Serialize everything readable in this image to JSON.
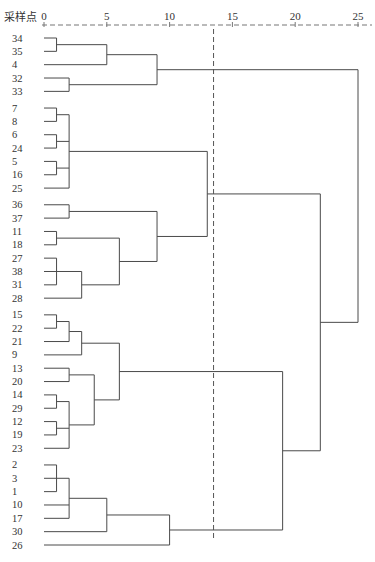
{
  "chart_data": {
    "type": "dendrogram",
    "title": "",
    "axis_title": "采样点",
    "xlabel": "Rescaled distance cluster combine",
    "x_ticks": [
      0,
      5,
      10,
      15,
      20,
      25
    ],
    "xlim": [
      0,
      25
    ],
    "cut_line": {
      "value": 13.5,
      "style": "dashed"
    },
    "leaves": [
      "34",
      "35",
      "4",
      "32",
      "33",
      "7",
      "8",
      "6",
      "24",
      "5",
      "16",
      "25",
      "36",
      "37",
      "11",
      "18",
      "27",
      "38",
      "31",
      "28",
      "15",
      "22",
      "21",
      "9",
      "13",
      "20",
      "14",
      "29",
      "12",
      "19",
      "23",
      "2",
      "3",
      "1",
      "10",
      "17",
      "30",
      "26"
    ],
    "merges": [
      {
        "id": "A",
        "children": [
          "34",
          "35"
        ],
        "height": 1
      },
      {
        "id": "B",
        "children": [
          "A",
          "4"
        ],
        "height": 5
      },
      {
        "id": "C",
        "children": [
          "32",
          "33"
        ],
        "height": 2
      },
      {
        "id": "D",
        "children": [
          "B",
          "C"
        ],
        "height": 9
      },
      {
        "id": "E1",
        "children": [
          "7",
          "8"
        ],
        "height": 1
      },
      {
        "id": "E2",
        "children": [
          "6",
          "24"
        ],
        "height": 1
      },
      {
        "id": "E3",
        "children": [
          "5",
          "16"
        ],
        "height": 1
      },
      {
        "id": "E",
        "children": [
          "E1",
          "E2",
          "E3",
          "25"
        ],
        "height": 2
      },
      {
        "id": "F",
        "children": [
          "36",
          "37"
        ],
        "height": 2
      },
      {
        "id": "G",
        "children": [
          "11",
          "18"
        ],
        "height": 1
      },
      {
        "id": "H",
        "children": [
          "27",
          "38",
          "31"
        ],
        "height": 1
      },
      {
        "id": "I",
        "children": [
          "H",
          "28"
        ],
        "height": 3
      },
      {
        "id": "J",
        "children": [
          "G",
          "I"
        ],
        "height": 6
      },
      {
        "id": "K",
        "children": [
          "F",
          "J"
        ],
        "height": 9
      },
      {
        "id": "L",
        "children": [
          "E",
          "K"
        ],
        "height": 13
      },
      {
        "id": "M1",
        "children": [
          "15",
          "22"
        ],
        "height": 1
      },
      {
        "id": "M2",
        "children": [
          "M1",
          "21"
        ],
        "height": 2
      },
      {
        "id": "M",
        "children": [
          "M2",
          "9"
        ],
        "height": 3
      },
      {
        "id": "N",
        "children": [
          "13",
          "20"
        ],
        "height": 2
      },
      {
        "id": "O1",
        "children": [
          "14",
          "29"
        ],
        "height": 1
      },
      {
        "id": "O2",
        "children": [
          "12",
          "19"
        ],
        "height": 1
      },
      {
        "id": "O",
        "children": [
          "O1",
          "O2",
          "23"
        ],
        "height": 2
      },
      {
        "id": "P",
        "children": [
          "N",
          "O"
        ],
        "height": 4
      },
      {
        "id": "Q",
        "children": [
          "M",
          "P"
        ],
        "height": 6
      },
      {
        "id": "R1",
        "children": [
          "2",
          "3",
          "1"
        ],
        "height": 1
      },
      {
        "id": "R",
        "children": [
          "R1",
          "10",
          "17"
        ],
        "height": 2
      },
      {
        "id": "S",
        "children": [
          "R",
          "30"
        ],
        "height": 5
      },
      {
        "id": "T",
        "children": [
          "S",
          "26"
        ],
        "height": 10
      },
      {
        "id": "U",
        "children": [
          "Q",
          "T"
        ],
        "height": 19
      },
      {
        "id": "V",
        "children": [
          "L",
          "U"
        ],
        "height": 22
      },
      {
        "id": "W",
        "children": [
          "D",
          "V"
        ],
        "height": 25
      }
    ]
  },
  "colors": {
    "line": "#4a4a4a",
    "text": "#333333",
    "axis_dashed": "#777777"
  }
}
